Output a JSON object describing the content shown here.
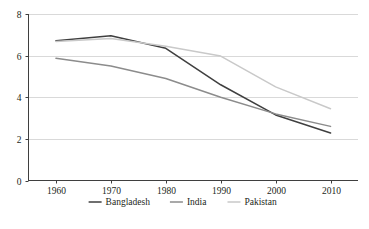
{
  "chart_data": {
    "type": "line",
    "title": "",
    "subtitle": "",
    "xlabel": "",
    "ylabel": "",
    "x": [
      1960,
      1970,
      1980,
      1990,
      2000,
      2010
    ],
    "xtick_labels": [
      "1960",
      "1970",
      "1980",
      "1990",
      "2000",
      "2010"
    ],
    "ytick_labels": [
      "0",
      "2",
      "4",
      "6",
      "8"
    ],
    "yticks": [
      0,
      2,
      4,
      6,
      8
    ],
    "ylim": [
      0,
      8
    ],
    "xlim": [
      1955,
      2015
    ],
    "grid": "horizontal",
    "legend_position": "bottom",
    "series": [
      {
        "name": "Bangladesh",
        "color": "#3f3f3f",
        "values": [
          6.72,
          6.95,
          6.35,
          4.6,
          3.15,
          2.28
        ]
      },
      {
        "name": "India",
        "color": "#8c8c8c",
        "values": [
          5.87,
          5.5,
          4.9,
          4.0,
          3.2,
          2.6
        ]
      },
      {
        "name": "Pakistan",
        "color": "#c9c9c9",
        "values": [
          6.68,
          6.82,
          6.45,
          5.98,
          4.5,
          3.45
        ]
      }
    ]
  },
  "axes": {
    "y_axis_name": "y-axis",
    "x_axis_name": "x-axis"
  },
  "colors": {
    "grid": "#d9d9d9",
    "axis": "#3f3f3f",
    "text": "#231f20",
    "background": "#ffffff"
  }
}
